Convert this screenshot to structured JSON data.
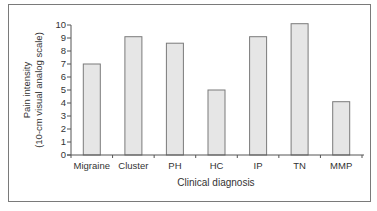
{
  "chart_data": {
    "type": "bar",
    "title": "",
    "xlabel": "Clinical diagnosis",
    "ylabel": "Pain intensity (10-cm visual analog scale)",
    "ylabel_lines": [
      "Pain intensity",
      "(10-cm visual analog scale)"
    ],
    "categories": [
      "Migraine",
      "Cluster",
      "PH",
      "HC",
      "IP",
      "TN",
      "MMP"
    ],
    "values": [
      7.0,
      9.1,
      8.6,
      5.0,
      9.1,
      10.1,
      4.1
    ],
    "ylim": [
      0,
      10
    ],
    "yticks": [
      0,
      1,
      2,
      3,
      4,
      5,
      6,
      7,
      8,
      9,
      10
    ],
    "grid": false,
    "legend": null,
    "colors": {
      "bar_fill": "#e6e6e6",
      "bar_edge": "#7a7a7a",
      "axis": "#555555",
      "frame": "#7a7a7a"
    }
  }
}
